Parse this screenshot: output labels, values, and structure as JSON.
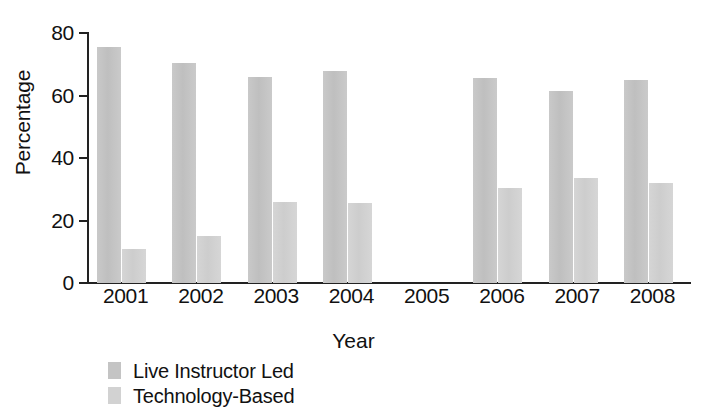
{
  "chart_data": {
    "type": "bar",
    "title": "",
    "subtitle": "",
    "xlabel": "Year",
    "ylabel": "Percentage",
    "categories": [
      "2001",
      "2002",
      "2003",
      "2004",
      "2005",
      "2006",
      "2007",
      "2008"
    ],
    "series": [
      {
        "name": "Live Instructor Led",
        "color": "#c4c4c4",
        "values": [
          75.5,
          70.5,
          66,
          68,
          null,
          65.5,
          61.5,
          65
        ]
      },
      {
        "name": "Technology-Based",
        "color": "#d2d2d2",
        "values": [
          11,
          15,
          26,
          25.5,
          null,
          30.5,
          33.5,
          32
        ]
      }
    ],
    "ylim": [
      0,
      80
    ],
    "yticks": [
      "0",
      "20",
      "40",
      "60",
      "80"
    ],
    "grid": false,
    "legend_position": "bottom-left"
  },
  "colors": {
    "axis": "#222222",
    "text": "#111111",
    "background": "#ffffff"
  }
}
